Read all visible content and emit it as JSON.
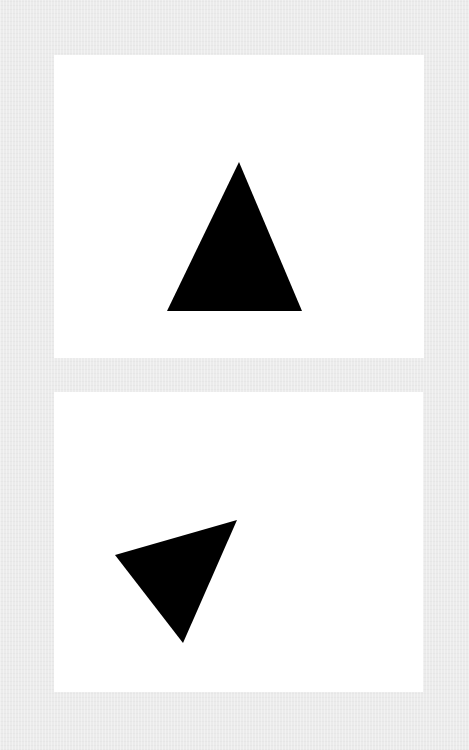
{
  "colors": {
    "background": "#ebebeb",
    "panel": "#ffffff",
    "shape": "#000000"
  },
  "panels": [
    {
      "name": "top-panel",
      "rect": {
        "x": 54,
        "y": 55,
        "w": 370,
        "h": 303
      },
      "shape": {
        "type": "triangle",
        "orientation": "upright",
        "points_page": [
          [
            239,
            162
          ],
          [
            167,
            311
          ],
          [
            302,
            311
          ]
        ]
      }
    },
    {
      "name": "bottom-panel",
      "rect": {
        "x": 54,
        "y": 392,
        "w": 369,
        "h": 300
      },
      "shape": {
        "type": "triangle",
        "orientation": "rotated",
        "points_page": [
          [
            115,
            555
          ],
          [
            237,
            520
          ],
          [
            183,
            643
          ]
        ]
      }
    }
  ]
}
